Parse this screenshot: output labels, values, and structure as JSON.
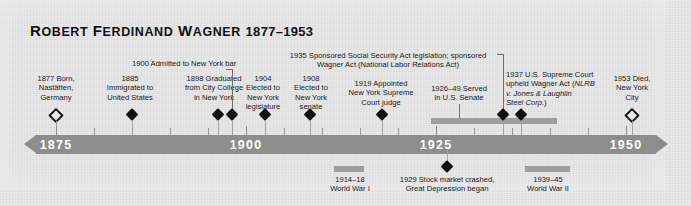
{
  "header": {
    "name": "ROBERT FERDINAND WAGNER",
    "life_dates": "1877–1953"
  },
  "axis": {
    "year_labels": [
      "1875",
      "1900",
      "1925",
      "1950"
    ],
    "start_year": 1872,
    "end_year": 1956,
    "bar_color": "#8d8d8d",
    "label_color": "#ffffff"
  },
  "events_above": [
    {
      "year": 1877,
      "text": "1877 Born,\nNastätten,\nGermany",
      "marker": "hollow-diamond"
    },
    {
      "year": 1885,
      "text": "1885\nImmigrated to\nUnited States",
      "marker": "diamond"
    },
    {
      "year": 1898,
      "text": "1898 Graduated\nfrom City College\nin New York",
      "marker": "diamond"
    },
    {
      "year": 1900,
      "text": "1900 Admitted to New York bar",
      "marker": "diamond",
      "leader": true
    },
    {
      "year": 1904,
      "text": "1904\nElected to\nNew York\nlegislature",
      "marker": "diamond"
    },
    {
      "year": 1908,
      "text": "1908\nElected to\nNew York\nsenate",
      "marker": "diamond"
    },
    {
      "year": 1919,
      "text": "1919 Appointed\nNew York Supreme\nCourt judge",
      "marker": "diamond"
    },
    {
      "year": 1926,
      "text": "1926–49 Served\nin U.S. Senate",
      "marker": "span",
      "span_end": 1949,
      "leader": true
    },
    {
      "year": 1935,
      "text": "1935 Sponsored Social Security Act legislation; sponsored\nWagner Act (National Labor Relations Act)",
      "marker": "diamond",
      "leader": true
    },
    {
      "year": 1937,
      "text": "1937 U.S. Supreme Court\nupheld Wagner Act (",
      "text_italic": "NLRB\nv. Jones & Laughlin\nSteel Corp.",
      "text_tail": ")",
      "marker": "diamond"
    },
    {
      "year": 1953,
      "text": "1953 Died,\nNew York\nCity",
      "marker": "hollow-diamond"
    }
  ],
  "events_below": [
    {
      "year": 1914,
      "text": "1914–18\nWorld War I",
      "marker": "span",
      "span_end": 1918
    },
    {
      "year": 1929,
      "text": "1929 Stock market crashed,\nGreat Depression began",
      "marker": "diamond"
    },
    {
      "year": 1939,
      "text": "1939–45\nWorld War II",
      "marker": "span",
      "span_end": 1945
    }
  ]
}
